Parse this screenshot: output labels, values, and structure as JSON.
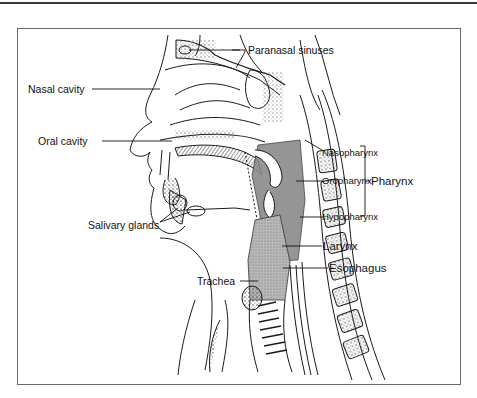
{
  "diagram": {
    "title": "",
    "labels": {
      "paranasal_sinuses": "Paranasal sinuses",
      "nasal_cavity": "Nasal cavity",
      "oral_cavity": "Oral cavity",
      "nasopharynx": "Nasopharynx",
      "oropharynx": "Oropharynx",
      "hypopharynx": "Hypopharynx",
      "pharynx": "Pharynx",
      "salivary_glands": "Salivary glands",
      "larynx": "Larynx",
      "trachea": "Trachea",
      "esophagus": "Esophagus"
    },
    "colors": {
      "line": "#1a1a1a",
      "pharynx_shade": "#8a8a8a",
      "larynx_shade": "#b5b5b5",
      "frame": "#6b6b6b"
    }
  }
}
